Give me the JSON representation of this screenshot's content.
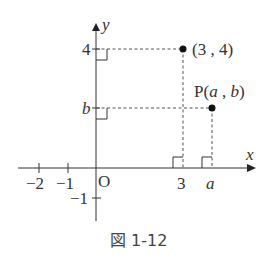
{
  "figure": {
    "caption": "図 1-12",
    "axes": {
      "x_label": "x",
      "y_label": "y",
      "origin_label": "O",
      "x_ticks": [
        {
          "label": "−2",
          "value": -2
        },
        {
          "label": "−1",
          "value": -1
        },
        {
          "label": "3",
          "value": 3
        },
        {
          "label": "a",
          "value": "a"
        }
      ],
      "y_ticks": [
        {
          "label": "4",
          "value": 4
        },
        {
          "label": "b",
          "value": "b"
        },
        {
          "label": "−1",
          "value": -1
        }
      ]
    },
    "points": [
      {
        "label": "(3 , 4)",
        "x": 3,
        "y": 4
      },
      {
        "label": "P(a , b)",
        "prefix": "P(",
        "a": "a",
        "sep": " , ",
        "b": "b",
        "suffix": ")",
        "x": "a",
        "y": "b"
      }
    ],
    "colors": {
      "ink": "#333333",
      "background": "#ffffff"
    }
  }
}
